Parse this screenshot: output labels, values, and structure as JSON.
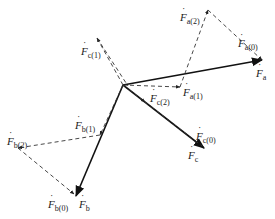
{
  "diagram": {
    "type": "vector-phasor-diagram",
    "origin": {
      "x": 123,
      "y": 85
    },
    "colors": {
      "solid": "#111111",
      "dashed": "#333333",
      "background": "#ffffff"
    },
    "vectors": [
      {
        "id": "Fa",
        "symbol": "F",
        "sub": "a",
        "style": "solid",
        "to": {
          "x": 262,
          "y": 60
        }
      },
      {
        "id": "Fb",
        "symbol": "F",
        "sub": "b",
        "style": "solid",
        "to": {
          "x": 76,
          "y": 196
        }
      },
      {
        "id": "Fc",
        "symbol": "F",
        "sub": "c",
        "style": "solid",
        "to": {
          "x": 204,
          "y": 148
        }
      },
      {
        "id": "Fa1",
        "symbol": "F",
        "sub": "a(1)",
        "style": "dashed",
        "to": {
          "x": 180,
          "y": 87
        }
      },
      {
        "id": "Fc1",
        "symbol": "F",
        "sub": "c(1)",
        "style": "dashed",
        "to": {
          "x": 97,
          "y": 38
        }
      },
      {
        "id": "Fb1",
        "symbol": "F",
        "sub": "b(1)",
        "style": "dashed",
        "to": {
          "x": 100,
          "y": 135
        }
      },
      {
        "id": "Fc2",
        "symbol": "F",
        "sub": "c(2)",
        "style": "dashed",
        "to": {
          "x": 145,
          "y": 102
        }
      }
    ],
    "labels": [
      {
        "id": "lbl-Fa2",
        "sub": "a(2)",
        "x": 180,
        "y": 12
      },
      {
        "id": "lbl-Fa0",
        "sub": "a(0)",
        "x": 250,
        "y": 38
      },
      {
        "id": "lbl-Fa",
        "sub": "a",
        "x": 258,
        "y": 68
      },
      {
        "id": "lbl-Fc1",
        "sub": "c(1)",
        "x": 81,
        "y": 48
      },
      {
        "id": "lbl-Fc2",
        "sub": "c(2)",
        "x": 150,
        "y": 95
      },
      {
        "id": "lbl-Fa1",
        "sub": "a(1)",
        "x": 183,
        "y": 88
      },
      {
        "id": "lbl-Fb1",
        "sub": "b(1)",
        "x": 75,
        "y": 121
      },
      {
        "id": "lbl-Fb2",
        "sub": "b(2)",
        "x": 7,
        "y": 136
      },
      {
        "id": "lbl-Fc0",
        "sub": "c(0)",
        "x": 197,
        "y": 131
      },
      {
        "id": "lbl-Fc",
        "sub": "c",
        "x": 188,
        "y": 150
      },
      {
        "id": "lbl-Fb0",
        "sub": "b(0)",
        "x": 48,
        "y": 199
      },
      {
        "id": "lbl-Fb",
        "sub": "b",
        "x": 77,
        "y": 199
      }
    ],
    "label_symbol": "F",
    "label_dot": "˙"
  }
}
